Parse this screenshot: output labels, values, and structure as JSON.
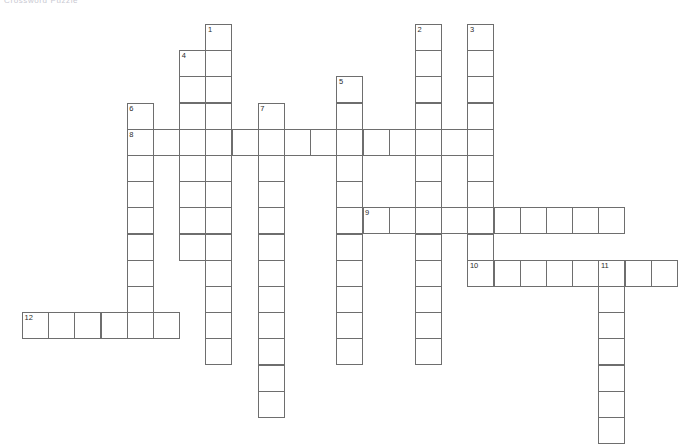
{
  "page": {
    "title": "Crossword Puzzle",
    "background_color": "#ffffff",
    "width": 687,
    "height": 434
  },
  "grid": {
    "cell_size": 27,
    "cell_step": 26.2,
    "origin_x": 22,
    "origin_y": 24,
    "border_color": "#6e6e6e",
    "cell_fill": "#ffffff",
    "number_color": "#2b2b2b"
  },
  "entries": [
    {
      "number": "1",
      "direction": "down",
      "col": 7,
      "row": 0,
      "length": 13
    },
    {
      "number": "2",
      "direction": "down",
      "col": 15,
      "row": 0,
      "length": 13
    },
    {
      "number": "3",
      "direction": "down",
      "col": 17,
      "row": 0,
      "length": 10
    },
    {
      "number": "4",
      "direction": "down",
      "col": 6,
      "row": 1,
      "length": 8
    },
    {
      "number": "5",
      "direction": "down",
      "col": 12,
      "row": 2,
      "length": 11
    },
    {
      "number": "6",
      "direction": "down",
      "col": 4,
      "row": 3,
      "length": 9
    },
    {
      "number": "7",
      "direction": "down",
      "col": 9,
      "row": 3,
      "length": 12
    },
    {
      "number": "8",
      "direction": "across",
      "col": 4,
      "row": 4,
      "length": 14
    },
    {
      "number": "9",
      "direction": "across",
      "col": 13,
      "row": 7,
      "length": 10
    },
    {
      "number": "10",
      "direction": "across",
      "col": 17,
      "row": 9,
      "length": 8
    },
    {
      "number": "11",
      "direction": "down",
      "col": 22,
      "row": 9,
      "length": 7
    },
    {
      "number": "12",
      "direction": "across",
      "col": 0,
      "row": 11,
      "length": 6
    }
  ],
  "numbered_cells": [
    {
      "number": "1",
      "col": 7,
      "row": 0
    },
    {
      "number": "2",
      "col": 15,
      "row": 0
    },
    {
      "number": "3",
      "col": 17,
      "row": 0
    },
    {
      "number": "4",
      "col": 6,
      "row": 1
    },
    {
      "number": "5",
      "col": 12,
      "row": 2
    },
    {
      "number": "6",
      "col": 4,
      "row": 3
    },
    {
      "number": "7",
      "col": 9,
      "row": 3
    },
    {
      "number": "8",
      "col": 4,
      "row": 4
    },
    {
      "number": "9",
      "col": 13,
      "row": 7
    },
    {
      "number": "10",
      "col": 17,
      "row": 9
    },
    {
      "number": "11",
      "col": 22,
      "row": 9
    },
    {
      "number": "12",
      "col": 0,
      "row": 11
    }
  ],
  "letters": []
}
